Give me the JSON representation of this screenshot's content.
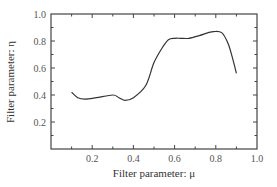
{
  "chart_data": {
    "type": "line",
    "title": "",
    "xlabel": "Filter parameter: μ",
    "ylabel": "Filter parameter: η",
    "xlim": [
      0.0,
      1.0
    ],
    "ylim": [
      0.0,
      1.0
    ],
    "x_ticks": [
      0.2,
      0.4,
      0.6,
      0.8,
      1.0
    ],
    "x_tick_labels": [
      "0.2",
      "0.4",
      "0.6",
      "0.8",
      "1.0"
    ],
    "y_ticks": [
      0.2,
      0.4,
      0.6,
      0.8,
      1.0
    ],
    "y_tick_labels": [
      "0.2",
      "0.4",
      "0.6",
      "0.8",
      "1.0"
    ],
    "grid": false,
    "legend": null,
    "series": [
      {
        "name": "η vs μ",
        "x": [
          0.1,
          0.13,
          0.165,
          0.22,
          0.3,
          0.33,
          0.36,
          0.4,
          0.46,
          0.5,
          0.54,
          0.57,
          0.6,
          0.63,
          0.67,
          0.72,
          0.76,
          0.79,
          0.83,
          0.86,
          0.88,
          0.9
        ],
        "y": [
          0.42,
          0.38,
          0.37,
          0.38,
          0.4,
          0.38,
          0.36,
          0.38,
          0.47,
          0.64,
          0.75,
          0.81,
          0.82,
          0.82,
          0.82,
          0.84,
          0.86,
          0.87,
          0.86,
          0.78,
          0.68,
          0.56
        ],
        "color": "#333333"
      }
    ]
  }
}
